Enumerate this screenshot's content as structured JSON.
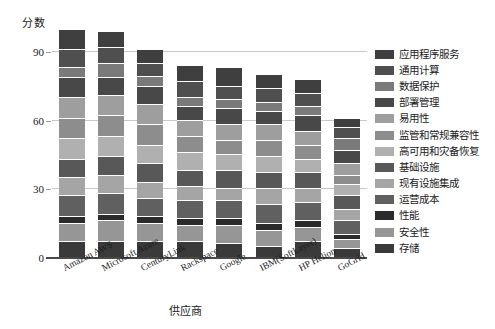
{
  "chart_data": {
    "type": "bar",
    "subtype": "stacked-bar",
    "title": "",
    "xlabel": "供应商",
    "ylabel": "分数",
    "ylim": [
      0,
      105
    ],
    "yticks": [
      0,
      30,
      60,
      90
    ],
    "ytick_labels": [
      "0",
      "30",
      "60",
      "90"
    ],
    "grid": true,
    "legend_position": "right",
    "categories": [
      "Amazon AWS",
      "Microsoft Azure",
      "CenturyLink",
      "Rackspace",
      "Google",
      "IBM(SoftLayer)",
      "HP Helion",
      "GoGrid"
    ],
    "totals": [
      100,
      99,
      91,
      84,
      83,
      80,
      78,
      61
    ],
    "series": [
      {
        "name": "应用程序服务",
        "color": "#3f3f3f",
        "values": [
          9,
          7,
          6,
          7,
          8,
          6,
          6,
          4
        ]
      },
      {
        "name": "通用计算",
        "color": "#4f4f4f",
        "values": [
          8,
          7,
          6,
          7,
          6,
          6,
          6,
          5
        ]
      },
      {
        "name": "数据保护",
        "color": "#7a7a7a",
        "values": [
          4,
          6,
          4,
          4,
          4,
          4,
          4,
          5
        ]
      },
      {
        "name": "部署管理",
        "color": "#484848",
        "values": [
          9,
          8,
          8,
          6,
          7,
          6,
          7,
          6
        ]
      },
      {
        "name": "易用性",
        "color": "#9e9e9e",
        "values": [
          9,
          9,
          9,
          7,
          7,
          7,
          6,
          5
        ]
      },
      {
        "name": "监管和常规兼容性",
        "color": "#8d8d8d",
        "values": [
          9,
          9,
          9,
          7,
          6,
          7,
          6,
          4
        ]
      },
      {
        "name": "高可用和灾备恢复",
        "color": "#b0b0b0",
        "values": [
          9,
          9,
          8,
          8,
          7,
          7,
          6,
          5
        ]
      },
      {
        "name": "基础设施",
        "color": "#585858",
        "values": [
          8,
          8,
          8,
          7,
          8,
          7,
          7,
          6
        ]
      },
      {
        "name": "现有设施集成",
        "color": "#a5a5a5",
        "values": [
          8,
          8,
          7,
          6,
          5,
          7,
          6,
          5
        ]
      },
      {
        "name": "运营成本",
        "color": "#606060",
        "values": [
          9,
          9,
          8,
          8,
          8,
          8,
          8,
          6
        ]
      },
      {
        "name": "性能",
        "color": "#2b2b2b",
        "values": [
          3,
          3,
          3,
          3,
          3,
          3,
          3,
          2
        ]
      },
      {
        "name": "安全性",
        "color": "#969696",
        "values": [
          8,
          9,
          8,
          7,
          8,
          7,
          6,
          4
        ]
      },
      {
        "name": "存储",
        "color": "#3a3a3a",
        "values": [
          7,
          7,
          7,
          7,
          6,
          5,
          7,
          4
        ]
      }
    ]
  },
  "axis": {
    "y_title": "分数",
    "x_title": "供应商",
    "y_tick_0": "0",
    "y_tick_1": "30",
    "y_tick_2": "60",
    "y_tick_3": "90"
  }
}
